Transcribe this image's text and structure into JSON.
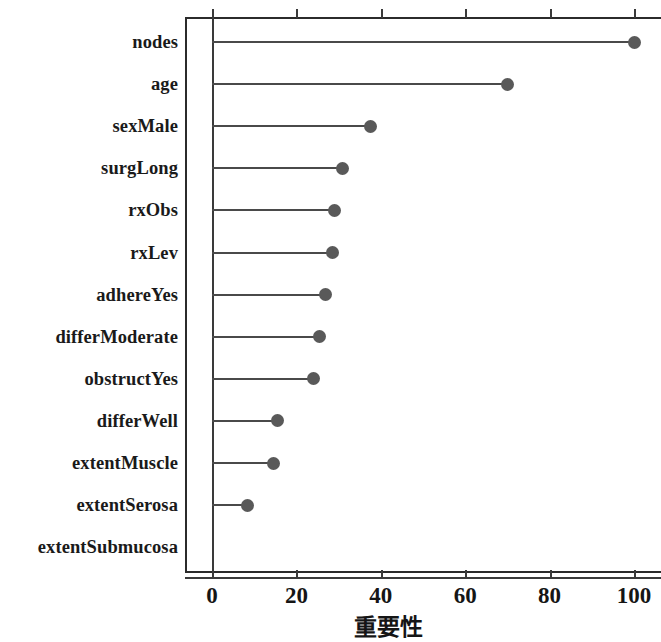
{
  "chart_data": {
    "type": "bar",
    "subtype": "lollipop-horizontal",
    "title": "",
    "subtitle": "",
    "xlabel": "重要性",
    "ylabel": "",
    "xlim": [
      0,
      103
    ],
    "ylim": [
      0,
      13
    ],
    "grid": false,
    "legend": null,
    "xticks": [
      0,
      20,
      40,
      60,
      80,
      100
    ],
    "xticklabels": [
      "0",
      "20",
      "40",
      "60",
      "80",
      "100"
    ],
    "categories": [
      "nodes",
      "age",
      "sexMale",
      "surgLong",
      "rxObs",
      "rxLev",
      "adhereYes",
      "differModerate",
      "obstructYes",
      "differWell",
      "extentMuscle",
      "extentSerosa",
      "extentSubmucosa"
    ],
    "values": [
      100,
      70,
      37.5,
      31,
      29,
      28.5,
      27,
      25.5,
      24,
      15.5,
      14.5,
      8.5,
      0
    ],
    "colors": {
      "dot": "#595959",
      "stem": "#4a4a4a",
      "axis": "#3a3a3a",
      "text": "#151515",
      "background": "#ffffff"
    }
  },
  "axis": {
    "x_title": "重要性",
    "tick_0": "0",
    "tick_20": "20",
    "tick_40": "40",
    "tick_60": "60",
    "tick_80": "80",
    "tick_100": "100"
  },
  "labels": {
    "nodes": "nodes",
    "age": "age",
    "sexMale": "sexMale",
    "surgLong": "surgLong",
    "rxObs": "rxObs",
    "rxLev": "rxLev",
    "adhereYes": "adhereYes",
    "differModerate": "differModerate",
    "obstructYes": "obstructYes",
    "differWell": "differWell",
    "extentMuscle": "extentMuscle",
    "extentSerosa": "extentSerosa",
    "extentSubmucosa": "extentSubmucosa"
  }
}
